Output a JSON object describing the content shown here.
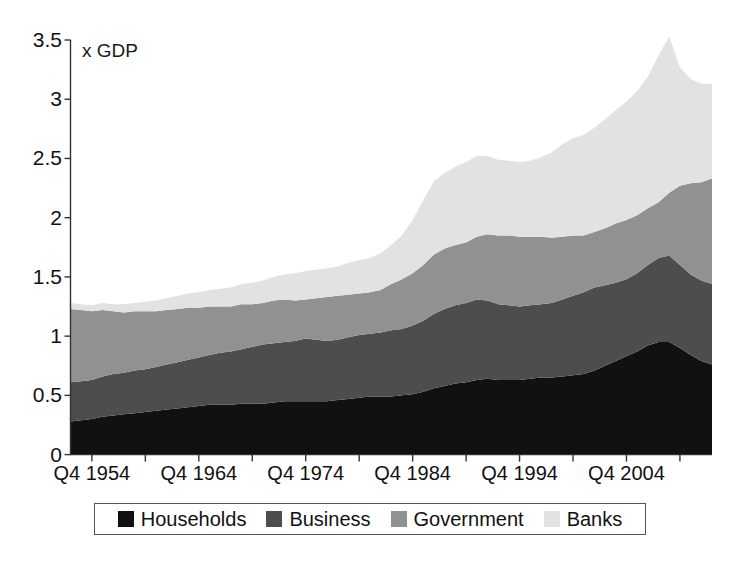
{
  "axis": {
    "y_unit_label": "x GDP",
    "y_ticks": [
      "0",
      "0.5",
      "1",
      "1.5",
      "2",
      "2.5",
      "3",
      "3.5"
    ],
    "x_ticks": [
      "Q4 1954",
      "Q4 1964",
      "Q4 1974",
      "Q4 1984",
      "Q4 1994",
      "Q4 2004"
    ]
  },
  "legend": {
    "items": [
      {
        "label": "Households",
        "color": "#111111"
      },
      {
        "label": "Business",
        "color": "#4d4d4d"
      },
      {
        "label": "Government",
        "color": "#919191"
      },
      {
        "label": "Banks",
        "color": "#e2e2e2"
      }
    ]
  },
  "chart_data": {
    "type": "area",
    "stacked": true,
    "title": "",
    "subtitle": "",
    "xlabel": "",
    "ylabel": "x GDP",
    "ylim": [
      0,
      3.5
    ],
    "ytick_values": [
      0,
      0.5,
      1,
      1.5,
      2,
      2.5,
      3,
      3.5
    ],
    "grid": false,
    "legend_position": "bottom",
    "xtick_labels": [
      "Q4 1954",
      "Q4 1964",
      "Q4 1974",
      "Q4 1984",
      "Q4 1994",
      "Q4 2004"
    ],
    "xtick_years": [
      1954,
      1964,
      1974,
      1984,
      1994,
      2004
    ],
    "minor_xtick_years": [
      1959,
      1969,
      1979,
      1989,
      1999,
      2009
    ],
    "x_start_year": 1952.0,
    "x_end_year": 2012.0,
    "x": [
      1952,
      1953,
      1954,
      1955,
      1956,
      1957,
      1958,
      1959,
      1960,
      1961,
      1962,
      1963,
      1964,
      1965,
      1966,
      1967,
      1968,
      1969,
      1970,
      1971,
      1972,
      1973,
      1974,
      1975,
      1976,
      1977,
      1978,
      1979,
      1980,
      1981,
      1982,
      1983,
      1984,
      1985,
      1986,
      1987,
      1988,
      1989,
      1990,
      1991,
      1992,
      1993,
      1994,
      1995,
      1996,
      1997,
      1998,
      1999,
      2000,
      2001,
      2002,
      2003,
      2004,
      2005,
      2006,
      2007,
      2008,
      2009,
      2010,
      2011,
      2012
    ],
    "series": [
      {
        "name": "Households",
        "color": "#111111",
        "values": [
          0.28,
          0.29,
          0.3,
          0.32,
          0.33,
          0.34,
          0.35,
          0.36,
          0.37,
          0.38,
          0.39,
          0.4,
          0.41,
          0.42,
          0.42,
          0.42,
          0.43,
          0.43,
          0.43,
          0.44,
          0.45,
          0.45,
          0.45,
          0.45,
          0.45,
          0.46,
          0.47,
          0.48,
          0.49,
          0.49,
          0.49,
          0.5,
          0.51,
          0.53,
          0.56,
          0.58,
          0.6,
          0.61,
          0.63,
          0.64,
          0.63,
          0.63,
          0.63,
          0.64,
          0.65,
          0.65,
          0.66,
          0.67,
          0.68,
          0.71,
          0.75,
          0.79,
          0.83,
          0.87,
          0.92,
          0.95,
          0.95,
          0.9,
          0.84,
          0.79,
          0.76
        ]
      },
      {
        "name": "Business",
        "color": "#4d4d4d",
        "values": [
          0.33,
          0.33,
          0.33,
          0.34,
          0.35,
          0.35,
          0.36,
          0.36,
          0.37,
          0.38,
          0.39,
          0.4,
          0.41,
          0.42,
          0.44,
          0.45,
          0.46,
          0.48,
          0.5,
          0.5,
          0.5,
          0.51,
          0.53,
          0.52,
          0.51,
          0.51,
          0.52,
          0.53,
          0.53,
          0.54,
          0.56,
          0.56,
          0.58,
          0.6,
          0.63,
          0.65,
          0.66,
          0.67,
          0.68,
          0.66,
          0.64,
          0.63,
          0.62,
          0.62,
          0.62,
          0.63,
          0.65,
          0.67,
          0.69,
          0.7,
          0.68,
          0.66,
          0.65,
          0.66,
          0.68,
          0.71,
          0.73,
          0.7,
          0.68,
          0.68,
          0.68
        ]
      },
      {
        "name": "Government",
        "color": "#919191",
        "values": [
          0.62,
          0.6,
          0.58,
          0.56,
          0.53,
          0.51,
          0.5,
          0.49,
          0.47,
          0.46,
          0.45,
          0.44,
          0.42,
          0.41,
          0.39,
          0.38,
          0.38,
          0.36,
          0.35,
          0.36,
          0.36,
          0.34,
          0.33,
          0.35,
          0.37,
          0.37,
          0.36,
          0.35,
          0.35,
          0.36,
          0.39,
          0.42,
          0.44,
          0.47,
          0.5,
          0.51,
          0.51,
          0.51,
          0.53,
          0.56,
          0.58,
          0.59,
          0.59,
          0.58,
          0.57,
          0.55,
          0.53,
          0.51,
          0.48,
          0.47,
          0.48,
          0.5,
          0.5,
          0.49,
          0.48,
          0.47,
          0.53,
          0.67,
          0.77,
          0.83,
          0.89
        ]
      },
      {
        "name": "Banks",
        "color": "#e2e2e2",
        "values": [
          0.05,
          0.05,
          0.05,
          0.06,
          0.06,
          0.07,
          0.07,
          0.08,
          0.09,
          0.1,
          0.11,
          0.12,
          0.13,
          0.14,
          0.15,
          0.16,
          0.17,
          0.18,
          0.19,
          0.2,
          0.21,
          0.23,
          0.24,
          0.24,
          0.24,
          0.25,
          0.27,
          0.28,
          0.29,
          0.31,
          0.33,
          0.37,
          0.45,
          0.55,
          0.62,
          0.64,
          0.66,
          0.68,
          0.68,
          0.66,
          0.64,
          0.63,
          0.63,
          0.64,
          0.67,
          0.72,
          0.78,
          0.82,
          0.85,
          0.88,
          0.92,
          0.96,
          1.0,
          1.05,
          1.11,
          1.24,
          1.32,
          1.0,
          0.88,
          0.83,
          0.8
        ]
      }
    ],
    "totals_note": "Stacked totals rise from about 1.28 in 1952 to a peak near 3.53 around 2008, ending near 3.13."
  }
}
